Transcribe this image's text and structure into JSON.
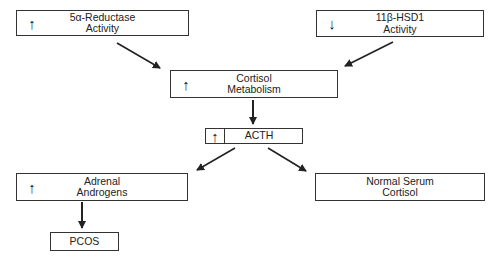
{
  "diagram": {
    "nodes": [
      {
        "id": "reductase",
        "indicator": "↑",
        "line1": "5α-Reductase",
        "line2": "Activity"
      },
      {
        "id": "hsd1",
        "indicator": "↓",
        "line1": "11β-HSD1",
        "line2": "Activity"
      },
      {
        "id": "cortisol_metabolism",
        "indicator": "↑",
        "line1": "Cortisol",
        "line2": "Metabolism"
      },
      {
        "id": "acth",
        "indicator": "↑",
        "line1": "ACTH"
      },
      {
        "id": "adrenal_androgens",
        "indicator": "↑",
        "line1": "Adrenal",
        "line2": "Androgens"
      },
      {
        "id": "normal_serum_cortisol",
        "line1": "Normal Serum",
        "line2": "Cortisol"
      },
      {
        "id": "pcos",
        "line1": "PCOS"
      }
    ],
    "edges": [
      {
        "from": "reductase",
        "to": "cortisol_metabolism"
      },
      {
        "from": "hsd1",
        "to": "cortisol_metabolism"
      },
      {
        "from": "cortisol_metabolism",
        "to": "acth"
      },
      {
        "from": "acth",
        "to": "adrenal_androgens"
      },
      {
        "from": "acth",
        "to": "normal_serum_cortisol"
      },
      {
        "from": "adrenal_androgens",
        "to": "pcos"
      }
    ]
  }
}
